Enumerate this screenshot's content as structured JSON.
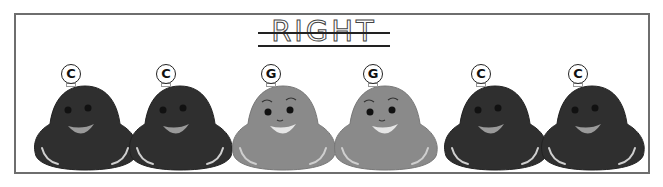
{
  "worksheet": {
    "title": "RIGHT",
    "characters": [
      {
        "letter": "C",
        "color": "#2f2f2f",
        "mouth": "#9a9a9a",
        "x": 30
      },
      {
        "letter": "C",
        "color": "#2f2f2f",
        "mouth": "#9a9a9a",
        "x": 125
      },
      {
        "letter": "G",
        "color": "#8a8a8a",
        "mouth": "#e6e6e6",
        "x": 228
      },
      {
        "letter": "G",
        "color": "#8a8a8a",
        "mouth": "#e6e6e6",
        "x": 330
      },
      {
        "letter": "C",
        "color": "#2f2f2f",
        "mouth": "#9a9a9a",
        "x": 440
      },
      {
        "letter": "C",
        "color": "#2f2f2f",
        "mouth": "#9a9a9a",
        "x": 537
      }
    ]
  }
}
